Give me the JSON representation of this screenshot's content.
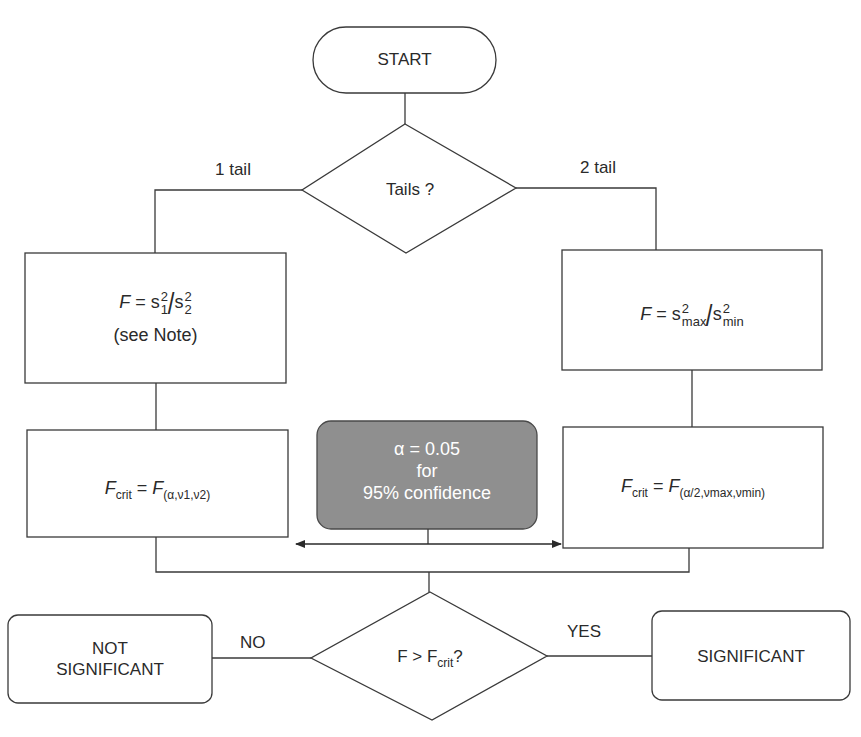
{
  "diagram": {
    "type": "flowchart",
    "colors": {
      "stroke": "#3a3a3a",
      "background": "#ffffff",
      "highlight_fill": "#8f8f8f",
      "highlight_text": "#ffffff"
    },
    "nodes": {
      "start": {
        "shape": "terminator",
        "label": "START"
      },
      "tails_decision": {
        "shape": "decision",
        "label": "Tails ?"
      },
      "one_tail_statistic": {
        "shape": "process",
        "formula": {
          "lhs": "F",
          "eq": " = ",
          "num_base": "s",
          "num_sup": "2",
          "num_sub": "1",
          "den_base": "s",
          "den_sup": "2",
          "den_sub": "2"
        },
        "note": "(see Note)"
      },
      "two_tail_statistic": {
        "shape": "process",
        "formula": {
          "lhs": "F",
          "eq": " = ",
          "num_base": "s",
          "num_sup": "2",
          "num_sub": "max",
          "den_base": "s",
          "den_sup": "2",
          "den_sub": "min"
        }
      },
      "one_tail_critical": {
        "shape": "process",
        "formula": {
          "lhs": "F",
          "lhs_sub": "crit",
          "eq": " = ",
          "rhs": "F",
          "rhs_sub": "(α,ν1,ν2)"
        }
      },
      "two_tail_critical": {
        "shape": "process",
        "formula": {
          "lhs": "F",
          "lhs_sub": "crit",
          "eq": " = ",
          "rhs": "F",
          "rhs_sub": "(α/2,νmax,νmin)"
        }
      },
      "alpha_note": {
        "shape": "rounded-highlight",
        "lines": [
          "α = 0.05",
          "for",
          "95% confidence"
        ]
      },
      "compare_decision": {
        "shape": "decision",
        "label_prefix": "F > F",
        "label_sub": "crit",
        "label_suffix": "?"
      },
      "not_significant": {
        "shape": "rounded",
        "lines": [
          "NOT",
          "SIGNIFICANT"
        ]
      },
      "significant": {
        "shape": "rounded",
        "label": "SIGNIFICANT"
      }
    },
    "edges": {
      "one_tail": "1 tail",
      "two_tail": "2 tail",
      "no": "NO",
      "yes": "YES"
    }
  }
}
